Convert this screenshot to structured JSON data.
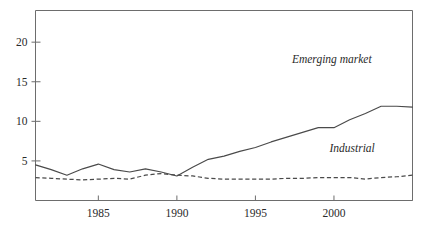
{
  "chart_data": {
    "type": "line",
    "title": "",
    "subtitle": "",
    "xlabel": "",
    "ylabel": "",
    "xlim": [
      1981,
      2005
    ],
    "ylim": [
      0,
      24
    ],
    "grid": false,
    "legend_position": "inline-annotation",
    "x": [
      1981,
      1982,
      1983,
      1984,
      1985,
      1986,
      1987,
      1988,
      1989,
      1990,
      1991,
      1992,
      1993,
      1994,
      1995,
      1996,
      1997,
      1998,
      1999,
      2000,
      2001,
      2002,
      2003,
      2004,
      2005
    ],
    "xticks": [
      1985,
      1990,
      1995,
      2000,
      2005
    ],
    "xtick_labels": [
      "1985",
      "1990",
      "1995",
      "2000",
      ""
    ],
    "yticks": [
      5,
      10,
      15,
      20
    ],
    "ytick_labels": [
      "5",
      "10",
      "15",
      "20"
    ],
    "series": [
      {
        "name": "Emerging market",
        "style": "solid",
        "color": "#4a4a4a",
        "label_anchor_x": 2002.4,
        "label_anchor_y": 17.4,
        "values": [
          4.5,
          3.9,
          3.2,
          4.0,
          4.6,
          3.9,
          3.6,
          4.0,
          3.6,
          3.1,
          4.2,
          5.2,
          5.6,
          6.2,
          6.7,
          7.4,
          8.0,
          8.6,
          9.2,
          9.2,
          10.2,
          11.0,
          11.9,
          11.9,
          11.8
        ]
      },
      {
        "name": "Industrial",
        "style": "dashed",
        "color": "#4a4a4a",
        "label_anchor_x": 2002.6,
        "label_anchor_y": 6.1,
        "values": [
          2.9,
          2.8,
          2.7,
          2.6,
          2.7,
          2.8,
          2.7,
          3.2,
          3.4,
          3.2,
          3.1,
          2.8,
          2.7,
          2.7,
          2.7,
          2.7,
          2.8,
          2.8,
          2.9,
          2.9,
          2.9,
          2.7,
          2.9,
          3.0,
          3.2
        ]
      }
    ],
    "series_extended": [
      {
        "name": "Emerging market",
        "x": [
          1981,
          1982,
          1983,
          1984,
          1985,
          1986,
          1987,
          1988,
          1989,
          1990,
          1991,
          1992,
          1993,
          1994,
          1995,
          1996,
          1997,
          1998,
          1999,
          2000,
          2001,
          2002,
          2003,
          2004,
          2005
        ],
        "values": [
          4.5,
          3.9,
          3.2,
          4.0,
          4.6,
          3.9,
          3.6,
          4.0,
          3.6,
          3.1,
          4.2,
          5.2,
          5.6,
          6.2,
          6.7,
          7.4,
          8.0,
          8.6,
          9.2,
          9.2,
          10.2,
          11.0,
          11.9,
          11.9,
          11.8
        ]
      }
    ]
  },
  "annotations": {
    "emerging_market_label": "Emerging market",
    "industrial_label": "Industrial"
  }
}
